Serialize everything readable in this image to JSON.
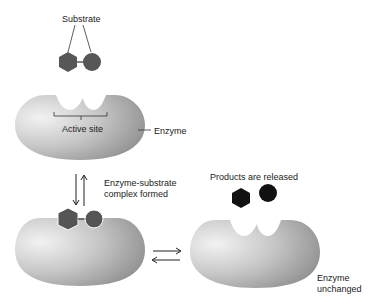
{
  "diagram": {
    "labels": {
      "substrate": "Substrate",
      "active_site": "Active site",
      "enzyme": "Enzyme",
      "complex_line1": "Enzyme-substrate",
      "complex_line2": "complex formed",
      "products": "Products are released",
      "unchanged_line1": "Enzyme",
      "unchanged_line2": "unchanged"
    },
    "colors": {
      "enzyme_light": "#e8e8e8",
      "enzyme_dark": "#9a9a9a",
      "substrate": "#555555",
      "product": "#111111",
      "line": "#333333"
    }
  }
}
